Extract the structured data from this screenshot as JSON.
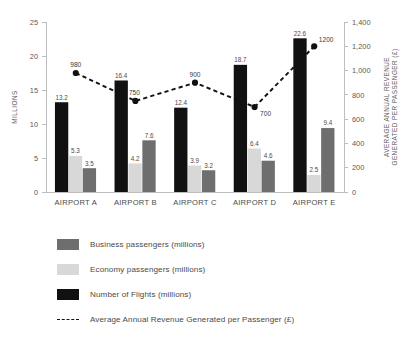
{
  "chart_data": {
    "type": "bar",
    "title": "",
    "categories": [
      "AIRPORT A",
      "AIRPORT B",
      "AIRPORT C",
      "AIRPORT D",
      "AIRPORT E"
    ],
    "series": [
      {
        "name": "Number of Flights (millions)",
        "axis": "left",
        "color": "#111111",
        "values": [
          13.2,
          16.4,
          12.4,
          18.7,
          22.6
        ]
      },
      {
        "name": "Economy passengers (millions)",
        "axis": "left",
        "color": "#d8d8d8",
        "values": [
          5.3,
          4.2,
          3.9,
          6.4,
          2.5
        ]
      },
      {
        "name": "Business passengers (millions)",
        "axis": "left",
        "color": "#6e6e6e",
        "values": [
          3.5,
          7.6,
          3.2,
          4.6,
          9.4
        ]
      },
      {
        "name": "Average Annual Revenue Generated per Passenger (£)",
        "axis": "right",
        "type": "line",
        "color": "#111111",
        "values": [
          980,
          750,
          900,
          700,
          1200
        ]
      }
    ],
    "left_axis": {
      "label": "MILLIONS",
      "ticks": [
        0,
        5,
        10,
        15,
        20,
        25
      ],
      "tick_labels": [
        "0",
        "5",
        "10",
        "15",
        "20",
        "25"
      ],
      "ylim": [
        0,
        25
      ]
    },
    "right_axis": {
      "label": "AVERAGE ANNUAL REVENUE GENERATED PER PASSENGER (£)",
      "ticks": [
        0,
        200,
        400,
        600,
        800,
        1000,
        1200,
        1400
      ],
      "tick_labels": [
        "0",
        "200",
        "400",
        "600",
        "800",
        "1,000",
        "1,200",
        "1,400"
      ],
      "ylim": [
        0,
        1400
      ]
    },
    "grid": false,
    "legend_position": "bottom-left"
  },
  "legend": {
    "items": [
      {
        "label": "Business passengers (millions)",
        "marker": "swatch",
        "color": "#6e6e6e"
      },
      {
        "label": "Economy passengers (millions)",
        "marker": "swatch",
        "color": "#d8d8d8"
      },
      {
        "label": "Number of Flights (millions)",
        "marker": "swatch",
        "color": "#111111"
      },
      {
        "label": "Average Annual Revenue Generated per Passenger (£)",
        "marker": "dashed-line",
        "color": "#111111"
      }
    ]
  }
}
